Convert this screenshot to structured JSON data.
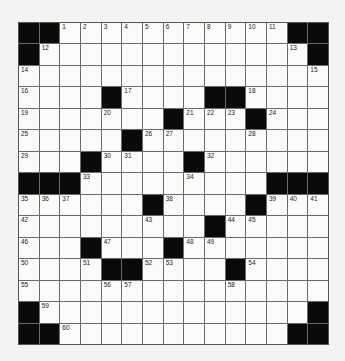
{
  "puzzle": {
    "rows": 15,
    "cols": 15,
    "colors": {
      "block": "#0a0a0a",
      "cell": "#fbfbfa",
      "grid_line": "#6a6a6a",
      "background": "#f3f3f1"
    },
    "grid": [
      [
        "#",
        "#",
        "1",
        "2",
        "3",
        "4",
        "5",
        "6",
        "7",
        "8",
        "9",
        "10",
        "11",
        "#",
        "#"
      ],
      [
        "#",
        "12",
        "",
        "",
        "",
        "",
        "",
        "",
        "",
        "",
        "",
        "",
        "",
        "13",
        "#"
      ],
      [
        "14",
        "",
        "",
        "",
        "",
        "",
        "",
        "",
        "",
        "",
        "",
        "",
        "",
        "",
        "15"
      ],
      [
        "16",
        "",
        "",
        "",
        "#",
        "17",
        "",
        "",
        "",
        "#",
        "#",
        "18",
        "",
        "",
        ""
      ],
      [
        "19",
        "",
        "",
        "",
        "20",
        "",
        "",
        "#",
        "21",
        "22",
        "23",
        "#",
        "24",
        "",
        ""
      ],
      [
        "25",
        "",
        "",
        "",
        "",
        "#",
        "26",
        "27",
        "",
        "",
        "",
        "28",
        "",
        "",
        ""
      ],
      [
        "29",
        "",
        "",
        "#",
        "30",
        "31",
        "",
        "",
        "#",
        "32",
        "",
        "",
        "",
        "",
        ""
      ],
      [
        "#",
        "#",
        "#",
        "33",
        "",
        "",
        "",
        "",
        "34",
        "",
        "",
        "",
        "#",
        "#",
        "#"
      ],
      [
        "35",
        "36",
        "37",
        "",
        "",
        "",
        "#",
        "38",
        "",
        "",
        "",
        "#",
        "39",
        "40",
        "41"
      ],
      [
        "42",
        "",
        "",
        "",
        "",
        "",
        "43",
        "",
        "",
        "#",
        "44",
        "45",
        "",
        "",
        ""
      ],
      [
        "46",
        "",
        "",
        "#",
        "47",
        "",
        "",
        "#",
        "48",
        "49",
        "",
        "",
        "",
        "",
        ""
      ],
      [
        "50",
        "",
        "",
        "51",
        "#",
        "#",
        "52",
        "53",
        "",
        "",
        "#",
        "54",
        "",
        "",
        ""
      ],
      [
        "55",
        "",
        "",
        "",
        "56",
        "57",
        "",
        "",
        "",
        "",
        "58",
        "",
        "",
        "",
        ""
      ],
      [
        "#",
        "59",
        "",
        "",
        "",
        "",
        "",
        "",
        "",
        "",
        "",
        "",
        "",
        "",
        "#"
      ],
      [
        "#",
        "#",
        "60",
        "",
        "",
        "",
        "",
        "",
        "",
        "",
        "",
        "",
        "",
        "#",
        "#"
      ]
    ]
  }
}
